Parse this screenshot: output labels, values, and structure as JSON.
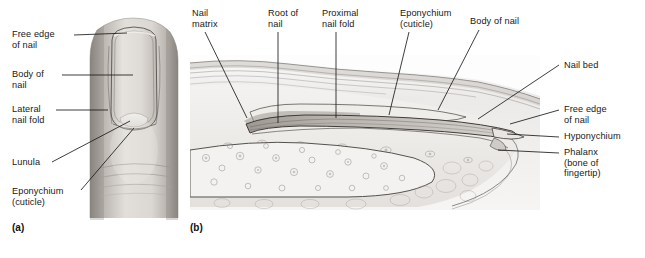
{
  "figure": {
    "panels": [
      {
        "tag": "(a)",
        "view": "surface view of fingertip and nail",
        "tag_x": 12,
        "tag_y": 222
      },
      {
        "tag": "(b)",
        "view": "sagittal section of fingertip",
        "tag_x": 190,
        "tag_y": 222
      }
    ]
  },
  "panel_a": {
    "labels": [
      {
        "id": "free-edge-of-nail",
        "text": "Free edge\nof nail",
        "x": 12,
        "y": 30,
        "leader": "M74,35 L125,35"
      },
      {
        "id": "body-of-nail",
        "text": "Body of\nnail",
        "x": 12,
        "y": 70,
        "leader": "M62,75 L133,75"
      },
      {
        "id": "lateral-nail-fold",
        "text": "Lateral\nnail fold",
        "x": 12,
        "y": 105,
        "leader": "M56,110 L105,110"
      },
      {
        "id": "lunula",
        "text": "Lunula",
        "x": 12,
        "y": 159,
        "leader": "M52,162 L130,121"
      },
      {
        "id": "eponychium",
        "text": "Eponychium\n(cuticle)",
        "x": 12,
        "y": 189,
        "leader": "M80,190 L133,128"
      }
    ]
  },
  "panel_b": {
    "labels": [
      {
        "id": "nail-matrix",
        "text": "Nail\nmatrix",
        "x": 192,
        "y": 8,
        "leader": "M205,32 L246,117"
      },
      {
        "id": "root-of-nail",
        "text": "Root of\nnail",
        "x": 268,
        "y": 8,
        "leader": "M278,32 L278,122"
      },
      {
        "id": "proximal-nail-fold",
        "text": "Proximal\nnail fold",
        "x": 322,
        "y": 8,
        "leader": "M336,32 L336,118"
      },
      {
        "id": "eponychium",
        "text": "Eponychium\n(cuticle)",
        "x": 400,
        "y": 8,
        "leader": "M408,32 L388,114"
      },
      {
        "id": "body-of-nail",
        "text": "Body of nail",
        "x": 470,
        "y": 16,
        "leader": "M478,28 L437,109"
      },
      {
        "id": "nail-bed",
        "text": "Nail bed",
        "x": 563,
        "y": 60,
        "leader": "M558,65 L478,118"
      },
      {
        "id": "free-edge-of-nail",
        "text": "Free edge\nof nail",
        "x": 563,
        "y": 105,
        "leader": "M558,110 L508,122"
      },
      {
        "id": "hyponychium",
        "text": "Hyponychium",
        "x": 563,
        "y": 133,
        "leader": "M558,136 L506,132"
      },
      {
        "id": "phalanx",
        "text": "Phalanx\n(bone of\nfingertip)",
        "x": 563,
        "y": 150,
        "leader": "M558,153 L500,148"
      }
    ]
  },
  "colors": {
    "leader_line": "#1b1b1b",
    "text": "#181818",
    "background": "#ffffff",
    "skin_light": "#e9e6e2",
    "skin_mid": "#c9c4bf",
    "skin_dark": "#8e8983",
    "nail_plate": "#d8d5d1",
    "nail_outline": "#4a4744",
    "tissue_light": "#f1efed",
    "tissue_line": "#6d6a66"
  }
}
